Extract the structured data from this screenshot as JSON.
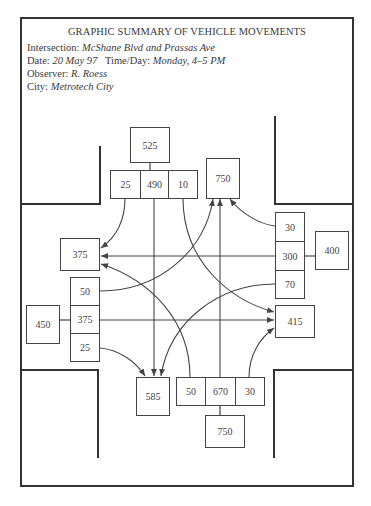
{
  "header": {
    "title": "GRAPHIC SUMMARY OF VEHICLE MOVEMENTS",
    "intersection_label": "Intersection:",
    "intersection_value": "McShane Blvd and Prassas Ave",
    "date_label": "Date:",
    "date_value": "20 May 97",
    "time_label": "Time/Day:",
    "time_value": "Monday, 4–5 PM",
    "observer_label": "Observer:",
    "observer_value": "R. Roess",
    "city_label": "City:",
    "city_value": "Metrotech City"
  },
  "approaches": {
    "north": {
      "total_in": "525",
      "left": "25",
      "through": "490",
      "right": "10",
      "total_out": "750"
    },
    "west": {
      "total_in": "450",
      "left": "50",
      "through": "375",
      "right": "25",
      "total_out": "375"
    },
    "east": {
      "total_in": "400",
      "right": "30",
      "through": "300",
      "left": "70",
      "total_out": "415"
    },
    "south": {
      "total_in": "750",
      "left": "50",
      "through": "670",
      "right": "30",
      "total_out": "585"
    }
  },
  "colors": {
    "line": "#444444",
    "frame": "#333333",
    "text": "#3a3a3a"
  }
}
